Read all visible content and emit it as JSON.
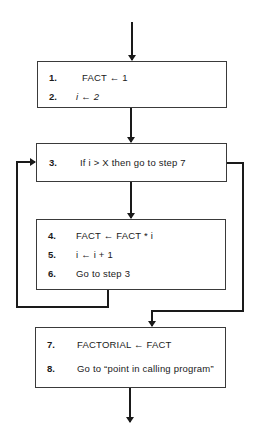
{
  "diagram": {
    "type": "flowchart",
    "colors": {
      "line": "#1a1a1a",
      "box_border": "#3a3a3a",
      "background": "#ffffff"
    },
    "boxes": [
      {
        "id": "init",
        "steps": [
          {
            "num": "1.",
            "text": "FACT ← 1"
          },
          {
            "num": "2.",
            "text": "i ← 2"
          }
        ]
      },
      {
        "id": "test",
        "steps": [
          {
            "num": "3.",
            "text": "If i > X then go to step 7"
          }
        ]
      },
      {
        "id": "loop-body",
        "steps": [
          {
            "num": "4.",
            "text": "FACT ← FACT * i"
          },
          {
            "num": "5.",
            "text": "i ← i + 1"
          },
          {
            "num": "6.",
            "text": "Go to step 3"
          }
        ]
      },
      {
        "id": "finish",
        "steps": [
          {
            "num": "7.",
            "text": "FACTORIAL ← FACT"
          },
          {
            "num": "8.",
            "text": "Go to “point in calling program”"
          }
        ]
      }
    ],
    "edges": [
      {
        "from": "entry",
        "to": "init"
      },
      {
        "from": "init",
        "to": "test"
      },
      {
        "from": "test",
        "to": "loop-body",
        "condition": "i <= X"
      },
      {
        "from": "test",
        "to": "finish",
        "condition": "i > X"
      },
      {
        "from": "loop-body",
        "to": "test",
        "label": "loop back"
      },
      {
        "from": "finish",
        "to": "exit"
      }
    ]
  }
}
